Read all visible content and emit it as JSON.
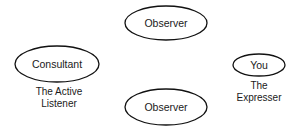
{
  "diagram": {
    "nodes": [
      {
        "id": "observer-top",
        "label": "Observer",
        "cx": 166,
        "cy": 23,
        "rx": 41,
        "ry": 17
      },
      {
        "id": "consultant",
        "label": "Consultant",
        "cx": 57,
        "cy": 64,
        "rx": 42,
        "ry": 18
      },
      {
        "id": "you",
        "label": "You",
        "cx": 259,
        "cy": 65,
        "rx": 26,
        "ry": 11
      },
      {
        "id": "observer-bottom",
        "label": "Observer",
        "cx": 166,
        "cy": 107,
        "rx": 41,
        "ry": 18
      }
    ],
    "captions": {
      "consultant": {
        "line1": "The Active",
        "line2": "Listener"
      },
      "you": {
        "line1": "The",
        "line2": "Expresser"
      }
    },
    "colors": {
      "stroke": "#111111",
      "text": "#1a1a1a",
      "background": "#ffffff"
    }
  }
}
